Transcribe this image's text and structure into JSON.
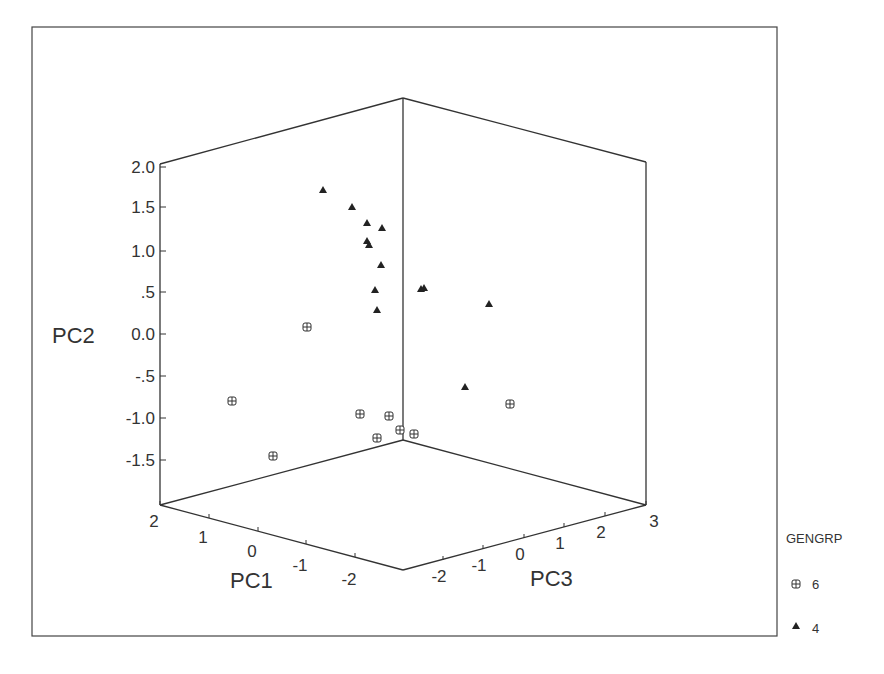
{
  "chart_data": {
    "type": "scatter3d",
    "title": "",
    "axes": {
      "x": {
        "label": "PC1",
        "ticks": [
          "2",
          "1",
          "0",
          "-1",
          "-2"
        ]
      },
      "y": {
        "label": "PC2",
        "ticks": [
          "2.0",
          "1.5",
          "1.0",
          ".5",
          "0.0",
          "-.5",
          "-1.0",
          "-1.5"
        ]
      },
      "z": {
        "label": "PC3",
        "ticks": [
          "-2",
          "-1",
          "0",
          "1",
          "2",
          "3"
        ]
      }
    },
    "legend": {
      "title": "GENGRP",
      "entries": [
        {
          "label": "6",
          "marker": "circle-plus-square"
        },
        {
          "label": "4",
          "marker": "triangle"
        }
      ]
    },
    "series": [
      {
        "name": "6",
        "marker": "square-cross",
        "screen_points": [
          [
            307,
            327
          ],
          [
            232,
            401
          ],
          [
            273,
            456
          ],
          [
            360,
            414
          ],
          [
            389,
            416
          ],
          [
            377,
            438
          ],
          [
            400,
            430
          ],
          [
            414,
            434
          ],
          [
            510,
            404
          ]
        ]
      },
      {
        "name": "4",
        "marker": "triangle",
        "screen_points": [
          [
            323,
            190
          ],
          [
            352,
            207
          ],
          [
            367,
            223
          ],
          [
            382,
            228
          ],
          [
            367,
            241
          ],
          [
            369,
            245
          ],
          [
            381,
            265
          ],
          [
            375,
            290
          ],
          [
            377,
            310
          ],
          [
            421,
            289
          ],
          [
            424,
            288
          ],
          [
            489,
            304
          ],
          [
            465,
            387
          ]
        ]
      }
    ],
    "grid": false
  },
  "labels": {
    "pc1": "PC1",
    "pc2": "PC2",
    "pc3": "PC3",
    "legend_title": "GENGRP",
    "legend_6": "6",
    "legend_4": "4",
    "y_ticks": [
      "2.0",
      "1.5",
      "1.0",
      ".5",
      "0.0",
      "-.5",
      "-1.0",
      "-1.5"
    ],
    "x_ticks": [
      "2",
      "1",
      "0",
      "-1",
      "-2"
    ],
    "z_ticks": [
      "-2",
      "-1",
      "0",
      "1",
      "2",
      "3"
    ]
  }
}
